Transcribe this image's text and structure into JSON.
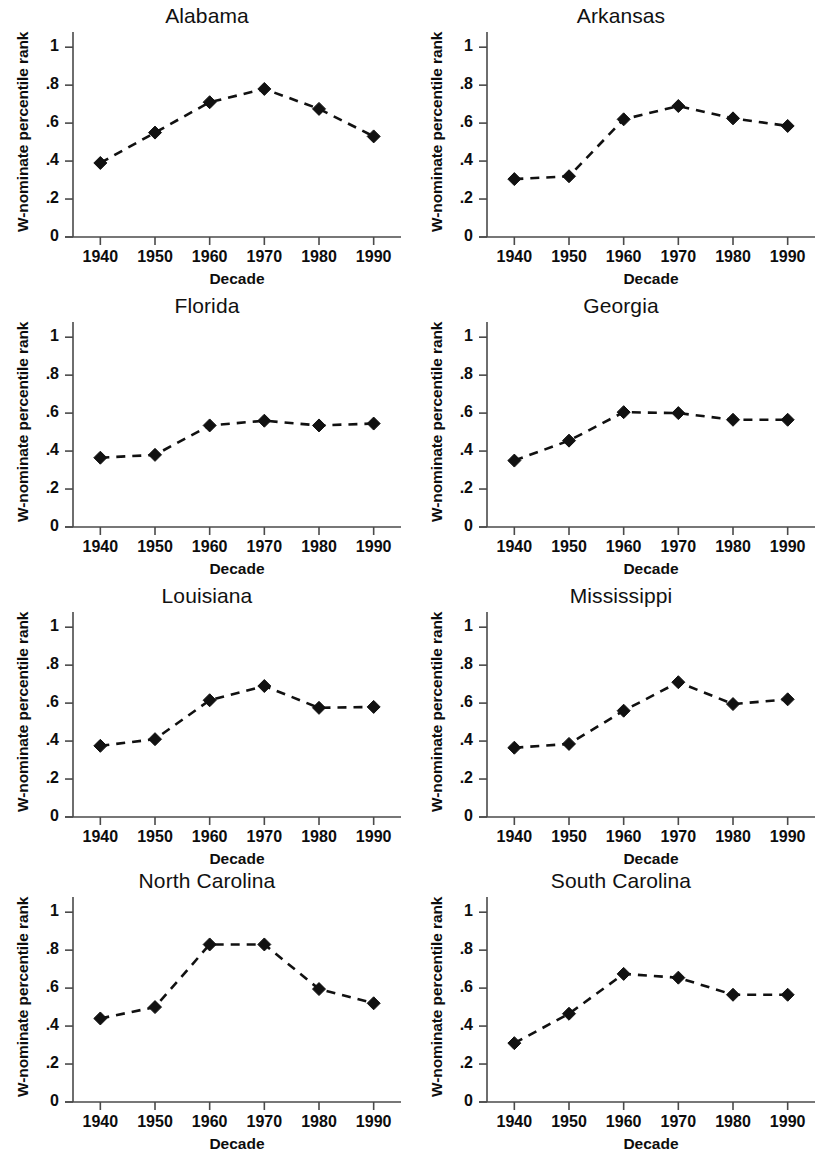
{
  "figure": {
    "panel_count": 8,
    "layout": "4 rows x 2 columns"
  },
  "axis": {
    "xlabel": "Decade",
    "ylabel": "W-nominate percentile rank",
    "xticks": [
      "1940",
      "1950",
      "1960",
      "1970",
      "1980",
      "1990"
    ],
    "yticks": [
      "0",
      ".2",
      ".4",
      ".6",
      ".8",
      "1"
    ]
  },
  "panels": [
    {
      "title": "Alabama"
    },
    {
      "title": "Arkansas"
    },
    {
      "title": "Florida"
    },
    {
      "title": "Georgia"
    },
    {
      "title": "Louisiana"
    },
    {
      "title": "Mississippi"
    },
    {
      "title": "North Carolina"
    },
    {
      "title": "South Carolina"
    }
  ],
  "chart_data": [
    {
      "type": "line",
      "title": "Alabama",
      "xlabel": "Decade",
      "ylabel": "W-nominate percentile rank",
      "x": [
        1940,
        1950,
        1960,
        1970,
        1980,
        1990
      ],
      "categories": [
        "1940",
        "1950",
        "1960",
        "1970",
        "1980",
        "1990"
      ],
      "values": [
        0.39,
        0.55,
        0.71,
        0.78,
        0.675,
        0.53
      ],
      "xlim": [
        1935,
        1995
      ],
      "ylim": [
        0,
        1.08
      ],
      "grid": false,
      "legend": "none",
      "marker": "diamond",
      "linestyle": "dashed",
      "color": "#111111"
    },
    {
      "type": "line",
      "title": "Arkansas",
      "xlabel": "Decade",
      "ylabel": "W-nominate percentile rank",
      "x": [
        1940,
        1950,
        1960,
        1970,
        1980,
        1990
      ],
      "categories": [
        "1940",
        "1950",
        "1960",
        "1970",
        "1980",
        "1990"
      ],
      "values": [
        0.305,
        0.32,
        0.62,
        0.69,
        0.625,
        0.585
      ],
      "xlim": [
        1935,
        1995
      ],
      "ylim": [
        0,
        1.08
      ],
      "grid": false,
      "legend": "none",
      "marker": "diamond",
      "linestyle": "dashed",
      "color": "#111111"
    },
    {
      "type": "line",
      "title": "Florida",
      "xlabel": "Decade",
      "ylabel": "W-nominate percentile rank",
      "x": [
        1940,
        1950,
        1960,
        1970,
        1980,
        1990
      ],
      "categories": [
        "1940",
        "1950",
        "1960",
        "1970",
        "1980",
        "1990"
      ],
      "values": [
        0.365,
        0.38,
        0.535,
        0.56,
        0.535,
        0.545
      ],
      "xlim": [
        1935,
        1995
      ],
      "ylim": [
        0,
        1.08
      ],
      "grid": false,
      "legend": "none",
      "marker": "diamond",
      "linestyle": "dashed",
      "color": "#111111"
    },
    {
      "type": "line",
      "title": "Georgia",
      "xlabel": "Decade",
      "ylabel": "W-nominate percentile rank",
      "x": [
        1940,
        1950,
        1960,
        1970,
        1980,
        1990
      ],
      "categories": [
        "1940",
        "1950",
        "1960",
        "1970",
        "1980",
        "1990"
      ],
      "values": [
        0.35,
        0.455,
        0.605,
        0.6,
        0.565,
        0.565
      ],
      "xlim": [
        1935,
        1995
      ],
      "ylim": [
        0,
        1.08
      ],
      "grid": false,
      "legend": "none",
      "marker": "diamond",
      "linestyle": "dashed",
      "color": "#111111"
    },
    {
      "type": "line",
      "title": "Louisiana",
      "xlabel": "Decade",
      "ylabel": "W-nominate percentile rank",
      "x": [
        1940,
        1950,
        1960,
        1970,
        1980,
        1990
      ],
      "categories": [
        "1940",
        "1950",
        "1960",
        "1970",
        "1980",
        "1990"
      ],
      "values": [
        0.375,
        0.41,
        0.615,
        0.69,
        0.575,
        0.58
      ],
      "xlim": [
        1935,
        1995
      ],
      "ylim": [
        0,
        1.08
      ],
      "grid": false,
      "legend": "none",
      "marker": "diamond",
      "linestyle": "dashed",
      "color": "#111111"
    },
    {
      "type": "line",
      "title": "Mississippi",
      "xlabel": "Decade",
      "ylabel": "W-nominate percentile rank",
      "x": [
        1940,
        1950,
        1960,
        1970,
        1980,
        1990
      ],
      "categories": [
        "1940",
        "1950",
        "1960",
        "1970",
        "1980",
        "1990"
      ],
      "values": [
        0.365,
        0.385,
        0.56,
        0.71,
        0.595,
        0.62
      ],
      "xlim": [
        1935,
        1995
      ],
      "ylim": [
        0,
        1.08
      ],
      "grid": false,
      "legend": "none",
      "marker": "diamond",
      "linestyle": "dashed",
      "color": "#111111"
    },
    {
      "type": "line",
      "title": "North Carolina",
      "xlabel": "Decade",
      "ylabel": "W-nominate percentile rank",
      "x": [
        1940,
        1950,
        1960,
        1970,
        1980,
        1990
      ],
      "categories": [
        "1940",
        "1950",
        "1960",
        "1970",
        "1980",
        "1990"
      ],
      "values": [
        0.44,
        0.5,
        0.83,
        0.83,
        0.595,
        0.52
      ],
      "xlim": [
        1935,
        1995
      ],
      "ylim": [
        0,
        1.08
      ],
      "grid": false,
      "legend": "none",
      "marker": "diamond",
      "linestyle": "dashed",
      "color": "#111111"
    },
    {
      "type": "line",
      "title": "South Carolina",
      "xlabel": "Decade",
      "ylabel": "W-nominate percentile rank",
      "x": [
        1940,
        1950,
        1960,
        1970,
        1980,
        1990
      ],
      "categories": [
        "1940",
        "1950",
        "1960",
        "1970",
        "1980",
        "1990"
      ],
      "values": [
        0.31,
        0.465,
        0.675,
        0.655,
        0.565,
        0.565
      ],
      "xlim": [
        1935,
        1995
      ],
      "ylim": [
        0,
        1.08
      ],
      "grid": false,
      "legend": "none",
      "marker": "diamond",
      "linestyle": "dashed",
      "color": "#111111"
    }
  ]
}
